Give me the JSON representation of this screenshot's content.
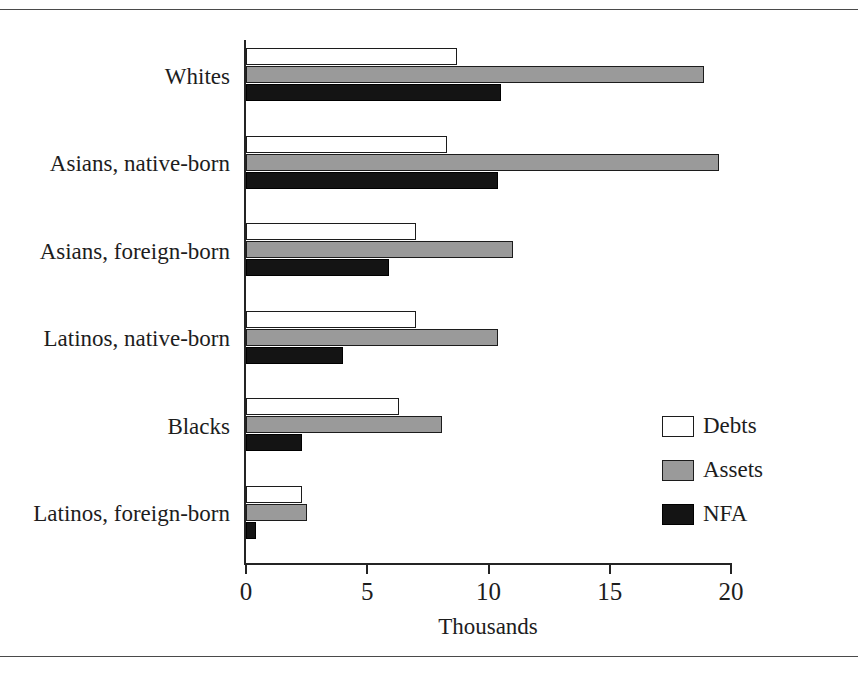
{
  "chart_data": {
    "type": "bar",
    "orientation": "horizontal",
    "title": "",
    "xlabel": "Thousands",
    "ylabel": "",
    "xlim": [
      0,
      20
    ],
    "xticks": [
      0,
      5,
      10,
      15,
      20
    ],
    "xtick_labels": [
      "0",
      "5",
      "10",
      "15",
      "20"
    ],
    "grid": false,
    "legend_position": "middle-right",
    "categories": [
      "Whites",
      "Asians, native-born",
      "Asians, foreign-born",
      "Latinos, native-born",
      "Blacks",
      "Latinos, foreign-born"
    ],
    "series": [
      {
        "name": "Debts",
        "color": "#ffffff",
        "values": [
          8.7,
          8.3,
          7.0,
          7.0,
          6.3,
          2.3
        ]
      },
      {
        "name": "Assets",
        "color": "#9a9a9a",
        "values": [
          18.9,
          19.5,
          11.0,
          10.4,
          8.1,
          2.5
        ]
      },
      {
        "name": "NFA",
        "color": "#141414",
        "values": [
          10.5,
          10.4,
          5.9,
          4.0,
          2.3,
          0.4
        ]
      }
    ]
  },
  "legend": {
    "items": [
      {
        "label": "Debts"
      },
      {
        "label": "Assets"
      },
      {
        "label": "NFA"
      }
    ]
  }
}
